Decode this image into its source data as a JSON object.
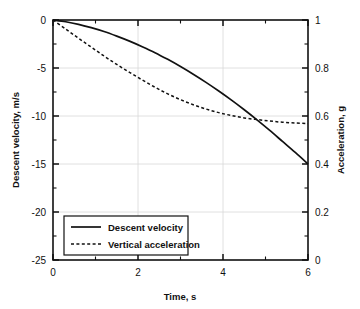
{
  "chart_data": {
    "type": "line",
    "title": "",
    "xlabel": "Time, s",
    "ylabel": "Descent velocity, m/s",
    "y2label": "Acceleration, g",
    "xlim": [
      0,
      6
    ],
    "ylim": [
      -25,
      0
    ],
    "y2lim": [
      0,
      1
    ],
    "grid": true,
    "legend_position": "lower-left",
    "xticks": [
      0,
      2,
      4,
      6
    ],
    "xtick_labels": [
      "0",
      "2",
      "4",
      "6"
    ],
    "xminor_ticks": [
      1,
      3,
      5
    ],
    "yticks": [
      0,
      -5,
      -10,
      -15,
      -20,
      -25
    ],
    "ytick_labels": [
      "0",
      "-5",
      "-10",
      "-15",
      "-20",
      "-25"
    ],
    "yminor_ticks": [
      -2.5,
      -7.5,
      -12.5,
      -17.5,
      -22.5
    ],
    "y2ticks": [
      1,
      0.8,
      0.6,
      0.4,
      0.2,
      0
    ],
    "y2tick_labels": [
      "1",
      "0.8",
      "0.6",
      "0.4",
      "0.2",
      "0"
    ],
    "y2minor_ticks": [
      0.9,
      0.7,
      0.5,
      0.3,
      0.1
    ],
    "series": [
      {
        "name": "Descent velocity",
        "style": "solid",
        "axis": "left",
        "x": [
          0,
          0.3,
          0.6,
          0.9,
          1.2,
          1.5,
          1.8,
          2.1,
          2.4,
          2.7,
          3.0,
          3.3,
          3.6,
          3.9,
          4.2,
          4.5,
          4.8,
          5.1,
          5.4,
          5.7,
          6.0
        ],
        "values": [
          0,
          -0.18,
          -0.45,
          -0.8,
          -1.2,
          -1.68,
          -2.2,
          -2.78,
          -3.4,
          -4.1,
          -4.85,
          -5.65,
          -6.5,
          -7.4,
          -8.35,
          -9.35,
          -10.4,
          -11.5,
          -12.65,
          -13.8,
          -15.0
        ]
      },
      {
        "name": "Vertical acceleration",
        "style": "dashed",
        "axis": "right",
        "x": [
          0,
          0.3,
          0.6,
          0.9,
          1.2,
          1.5,
          1.8,
          2.1,
          2.4,
          2.7,
          3.0,
          3.3,
          3.6,
          3.9,
          4.2,
          4.5,
          4.8,
          5.1,
          5.4,
          5.7,
          6.0
        ],
        "values": [
          1.0,
          0.962,
          0.924,
          0.887,
          0.85,
          0.815,
          0.782,
          0.75,
          0.72,
          0.692,
          0.668,
          0.647,
          0.629,
          0.614,
          0.602,
          0.592,
          0.585,
          0.579,
          0.574,
          0.571,
          0.568
        ]
      }
    ],
    "legend_entries": [
      {
        "label": "Descent velocity",
        "style": "solid"
      },
      {
        "label": "Vertical acceleration",
        "style": "dashed"
      }
    ]
  }
}
